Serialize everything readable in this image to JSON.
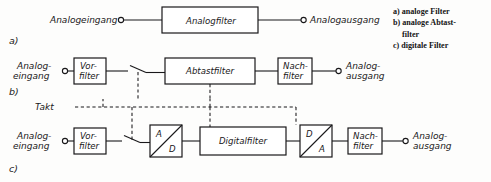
{
  "figure": {
    "rows": [
      {
        "key": "a",
        "row_label": "a)",
        "input_label": "Analogeingang",
        "output_label": "Analogausgang",
        "blocks": [
          {
            "name": "analogfilter",
            "label": "Analogfilter"
          }
        ]
      },
      {
        "key": "b",
        "row_label": "b)",
        "input_label_line1": "Analog-",
        "input_label_line2": "eingang",
        "output_label_line1": "Analog-",
        "output_label_line2": "ausgang",
        "blocks": [
          {
            "name": "vorfilter",
            "label_line1": "Vor-",
            "label_line2": "filter"
          },
          {
            "name": "abtastfilter",
            "label": "Abtastfilter"
          },
          {
            "name": "nachfilter",
            "label_line1": "Nach-",
            "label_line2": "filter"
          }
        ]
      },
      {
        "key": "c",
        "row_label": "c)",
        "clock_label": "Takt",
        "input_label_line1": "Analog-",
        "input_label_line2": "eingang",
        "output_label_line1": "Analog-",
        "output_label_line2": "ausgang",
        "blocks": [
          {
            "name": "vorfilter",
            "label_line1": "Vor-",
            "label_line2": "filter"
          },
          {
            "name": "ad-converter",
            "label_top": "A",
            "label_bottom": "D"
          },
          {
            "name": "digitalfilter",
            "label": "Digitalfilter"
          },
          {
            "name": "da-converter",
            "label_top": "D",
            "label_bottom": "A"
          },
          {
            "name": "nachfilter",
            "label_line1": "Nach-",
            "label_line2": "filter"
          }
        ]
      }
    ]
  },
  "legend": {
    "items": [
      {
        "marker": "a)",
        "text": "analoge Filter",
        "continuation": ""
      },
      {
        "marker": "b)",
        "text": "analoge Abtast-",
        "continuation": "filter"
      },
      {
        "marker": "c)",
        "text": "digitale Filter",
        "continuation": ""
      }
    ],
    "line_a": "a) analoge Filter",
    "line_b": "b) analoge Abtast-",
    "line_b_cont": "filter",
    "line_c": "c) digitale Filter"
  },
  "colors": {
    "ink": "#19181a",
    "paper": "#fdfdfc"
  }
}
